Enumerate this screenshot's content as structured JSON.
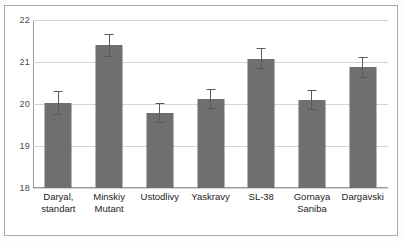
{
  "chart_data": {
    "type": "bar",
    "title": "",
    "subtitle": "",
    "xlabel": "",
    "ylabel": "",
    "ylim": [
      18,
      22
    ],
    "yticks": [
      "18",
      "19",
      "20",
      "21",
      "22"
    ],
    "ytick_values": [
      18,
      19,
      20,
      21,
      22
    ],
    "grid": true,
    "legend": "none",
    "bar_color": "#6f6f6f",
    "error_bar_color": "#5a5a5a",
    "gridline_color": "#d4d4d4",
    "axis_color": "#9a9a9a",
    "categories": [
      "Daryal, standart",
      "Minskiy Mutant",
      "Ustodlivy",
      "Yaskravy",
      "SL-38",
      "Gornaya Saniba",
      "Dargavski"
    ],
    "category_lines": [
      [
        "Daryal,",
        "standart"
      ],
      [
        "Minskiy",
        "Mutant"
      ],
      [
        "Ustodlivy",
        ""
      ],
      [
        "Yaskravy",
        ""
      ],
      [
        "SL-38",
        ""
      ],
      [
        "Gornaya",
        "Saniba"
      ],
      [
        "Dargavski",
        ""
      ]
    ],
    "values": [
      20.03,
      21.4,
      19.78,
      20.12,
      21.08,
      20.09,
      20.87
    ],
    "errors": [
      0.28,
      0.27,
      0.24,
      0.24,
      0.25,
      0.24,
      0.25
    ],
    "series": [
      {
        "name": "",
        "values": [
          20.03,
          21.4,
          19.78,
          20.12,
          21.08,
          20.09,
          20.87
        ],
        "errors": [
          0.28,
          0.27,
          0.24,
          0.24,
          0.25,
          0.24,
          0.25
        ]
      }
    ]
  }
}
